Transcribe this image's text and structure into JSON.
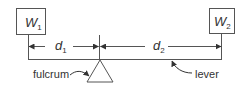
{
  "diagram": {
    "weights": [
      {
        "symbol": "W",
        "subscript": "1"
      },
      {
        "symbol": "W",
        "subscript": "2"
      }
    ],
    "distances": [
      {
        "symbol": "d",
        "subscript": "1"
      },
      {
        "symbol": "d",
        "subscript": "2"
      }
    ],
    "labels": {
      "fulcrum": "fulcrum",
      "lever": "lever"
    },
    "colors": {
      "stroke": "#555555",
      "text": "#333333",
      "background": "#ffffff"
    }
  }
}
